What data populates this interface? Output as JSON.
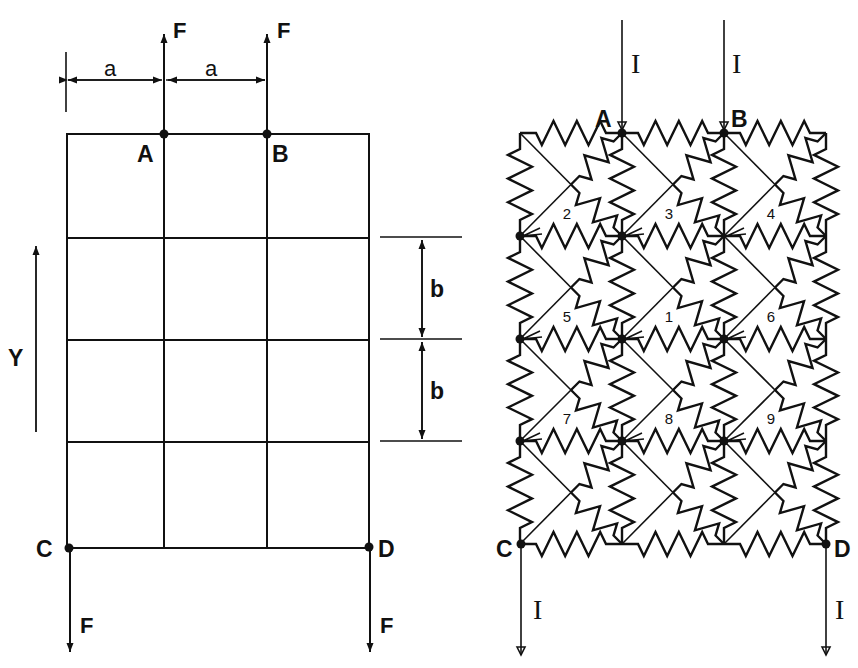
{
  "left_figure": {
    "title": "Plate grid with applied forces",
    "force_label": "F",
    "nodes": {
      "A": "A",
      "B": "B",
      "C": "C",
      "D": "D"
    },
    "dimension_horizontal": [
      "a",
      "a"
    ],
    "dimension_vertical": [
      "b",
      "b"
    ],
    "axis_label": "Y",
    "grid": {
      "columns": 3,
      "rows": 4
    }
  },
  "right_figure": {
    "title": "Resistor network analog",
    "current_label": "I",
    "nodes": {
      "A": "A",
      "B": "B",
      "C": "C",
      "D": "D"
    },
    "cell_numbers": [
      {
        "label": "2",
        "row": 0,
        "col": 0
      },
      {
        "label": "3",
        "row": 0,
        "col": 1
      },
      {
        "label": "4",
        "row": 0,
        "col": 2
      },
      {
        "label": "5",
        "row": 1,
        "col": 0
      },
      {
        "label": "1",
        "row": 1,
        "col": 1
      },
      {
        "label": "6",
        "row": 1,
        "col": 2
      },
      {
        "label": "7",
        "row": 2,
        "col": 0
      },
      {
        "label": "8",
        "row": 2,
        "col": 1
      },
      {
        "label": "9",
        "row": 2,
        "col": 2
      }
    ],
    "grid": {
      "columns": 3,
      "rows": 4
    }
  },
  "colors": {
    "ink": "#111111",
    "paper": "#ffffff"
  }
}
